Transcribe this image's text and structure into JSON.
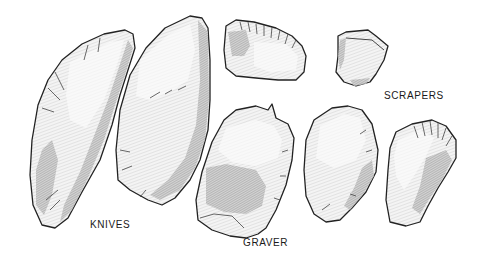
{
  "figure": {
    "colors": {
      "background": "#ffffff",
      "ink": "#222222"
    }
  },
  "labels": {
    "knives": "KNIVES",
    "graver": "GRAVER",
    "scrapers": "SCRAPERS"
  },
  "artifacts": [
    {
      "id": "knife-1",
      "category": "knife"
    },
    {
      "id": "knife-2",
      "category": "knife"
    },
    {
      "id": "scraper-top-left",
      "category": "scraper"
    },
    {
      "id": "scraper-top-right",
      "category": "scraper"
    },
    {
      "id": "graver-1",
      "category": "graver"
    },
    {
      "id": "scraper-middle",
      "category": "scraper"
    },
    {
      "id": "scraper-right",
      "category": "scraper"
    }
  ]
}
